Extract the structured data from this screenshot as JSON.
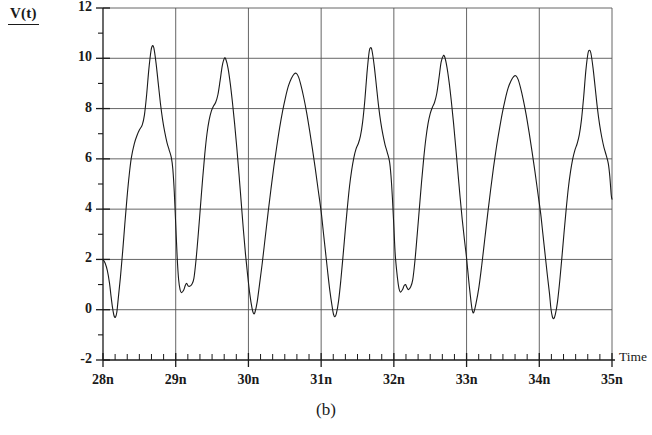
{
  "figure": {
    "caption": "(b)",
    "y_axis_label": "V(t)",
    "x_axis_label": "Time"
  },
  "chart_data": {
    "type": "line",
    "title": "",
    "subtitle": "",
    "xlabel": "Time",
    "ylabel": "V(t)",
    "xunit": "n",
    "xlim": [
      28,
      35
    ],
    "ylim": [
      -2,
      12
    ],
    "grid": true,
    "legend": "none",
    "x_tick_labels": [
      "28n",
      "29n",
      "30n",
      "31n",
      "32n",
      "33n",
      "34n",
      "35n"
    ],
    "x_ticks": [
      28,
      29,
      30,
      31,
      32,
      33,
      34,
      35
    ],
    "x_minor_ticks_per_interval": 5,
    "y_tick_labels": [
      "12",
      "10",
      "8",
      "6",
      "4",
      "2",
      "0",
      "-2"
    ],
    "y_ticks": [
      12,
      10,
      8,
      6,
      4,
      2,
      0,
      -2
    ],
    "y_minor_ticks_per_interval": 1,
    "line_color": "#1a1a1a",
    "line_width": 1.1,
    "gridline_color": "#555555",
    "axis_color": "#1a1a1a",
    "background": "#ffffff",
    "series": [
      {
        "name": "V(t)",
        "points": [
          [
            28.0,
            2.0
          ],
          [
            28.03,
            1.85
          ],
          [
            28.06,
            1.55
          ],
          [
            28.09,
            1.05
          ],
          [
            28.11,
            0.55
          ],
          [
            28.13,
            0.1
          ],
          [
            28.15,
            -0.22
          ],
          [
            28.17,
            -0.3
          ],
          [
            28.19,
            -0.1
          ],
          [
            28.21,
            0.45
          ],
          [
            28.24,
            1.3
          ],
          [
            28.27,
            2.3
          ],
          [
            28.3,
            3.4
          ],
          [
            28.33,
            4.45
          ],
          [
            28.36,
            5.35
          ],
          [
            28.39,
            6.05
          ],
          [
            28.43,
            6.6
          ],
          [
            28.47,
            6.95
          ],
          [
            28.5,
            7.15
          ],
          [
            28.54,
            7.35
          ],
          [
            28.57,
            7.75
          ],
          [
            28.6,
            8.55
          ],
          [
            28.63,
            9.55
          ],
          [
            28.66,
            10.3
          ],
          [
            28.68,
            10.5
          ],
          [
            28.7,
            10.4
          ],
          [
            28.73,
            9.8
          ],
          [
            28.76,
            9.0
          ],
          [
            28.79,
            8.2
          ],
          [
            28.82,
            7.55
          ],
          [
            28.85,
            7.05
          ],
          [
            28.88,
            6.65
          ],
          [
            28.91,
            6.35
          ],
          [
            28.94,
            6.05
          ],
          [
            28.96,
            5.6
          ],
          [
            28.98,
            4.7
          ],
          [
            29.0,
            3.4
          ],
          [
            29.02,
            2.1
          ],
          [
            29.04,
            1.2
          ],
          [
            29.06,
            0.8
          ],
          [
            29.08,
            0.68
          ],
          [
            29.11,
            0.78
          ],
          [
            29.13,
            0.95
          ],
          [
            29.15,
            1.05
          ],
          [
            29.17,
            0.95
          ],
          [
            29.19,
            0.93
          ],
          [
            29.22,
            1.0
          ],
          [
            29.25,
            1.25
          ],
          [
            29.28,
            2.0
          ],
          [
            29.31,
            3.0
          ],
          [
            29.34,
            4.1
          ],
          [
            29.37,
            5.2
          ],
          [
            29.4,
            6.2
          ],
          [
            29.43,
            7.0
          ],
          [
            29.46,
            7.55
          ],
          [
            29.49,
            7.9
          ],
          [
            29.52,
            8.1
          ],
          [
            29.55,
            8.25
          ],
          [
            29.58,
            8.55
          ],
          [
            29.61,
            9.1
          ],
          [
            29.64,
            9.7
          ],
          [
            29.67,
            10.0
          ],
          [
            29.69,
            9.95
          ],
          [
            29.72,
            9.6
          ],
          [
            29.75,
            9.0
          ],
          [
            29.78,
            8.25
          ],
          [
            29.81,
            7.4
          ],
          [
            29.84,
            6.45
          ],
          [
            29.87,
            5.4
          ],
          [
            29.9,
            4.3
          ],
          [
            29.93,
            3.2
          ],
          [
            29.96,
            2.2
          ],
          [
            29.99,
            1.35
          ],
          [
            30.02,
            0.6
          ],
          [
            30.05,
            0.05
          ],
          [
            30.07,
            -0.15
          ],
          [
            30.09,
            -0.1
          ],
          [
            30.12,
            0.3
          ],
          [
            30.15,
            0.95
          ],
          [
            30.19,
            1.85
          ],
          [
            30.23,
            2.85
          ],
          [
            30.27,
            3.85
          ],
          [
            30.31,
            4.8
          ],
          [
            30.35,
            5.7
          ],
          [
            30.39,
            6.5
          ],
          [
            30.43,
            7.25
          ],
          [
            30.47,
            7.9
          ],
          [
            30.51,
            8.45
          ],
          [
            30.55,
            8.9
          ],
          [
            30.59,
            9.2
          ],
          [
            30.63,
            9.38
          ],
          [
            30.66,
            9.4
          ],
          [
            30.69,
            9.25
          ],
          [
            30.72,
            8.95
          ],
          [
            30.76,
            8.45
          ],
          [
            30.8,
            7.85
          ],
          [
            30.84,
            7.15
          ],
          [
            30.88,
            6.4
          ],
          [
            30.92,
            5.6
          ],
          [
            30.96,
            4.75
          ],
          [
            31.0,
            3.9
          ],
          [
            31.03,
            3.1
          ],
          [
            31.06,
            2.3
          ],
          [
            31.09,
            1.5
          ],
          [
            31.12,
            0.75
          ],
          [
            31.15,
            0.15
          ],
          [
            31.17,
            -0.18
          ],
          [
            31.19,
            -0.28
          ],
          [
            31.21,
            -0.15
          ],
          [
            31.24,
            0.35
          ],
          [
            31.27,
            1.15
          ],
          [
            31.3,
            2.1
          ],
          [
            31.33,
            3.1
          ],
          [
            31.36,
            4.05
          ],
          [
            31.39,
            4.9
          ],
          [
            31.42,
            5.55
          ],
          [
            31.45,
            6.05
          ],
          [
            31.48,
            6.4
          ],
          [
            31.51,
            6.6
          ],
          [
            31.54,
            6.9
          ],
          [
            31.57,
            7.45
          ],
          [
            31.6,
            8.3
          ],
          [
            31.63,
            9.4
          ],
          [
            31.66,
            10.25
          ],
          [
            31.68,
            10.42
          ],
          [
            31.7,
            10.3
          ],
          [
            31.73,
            9.7
          ],
          [
            31.76,
            8.9
          ],
          [
            31.79,
            8.1
          ],
          [
            31.82,
            7.45
          ],
          [
            31.85,
            6.95
          ],
          [
            31.88,
            6.55
          ],
          [
            31.91,
            6.25
          ],
          [
            31.94,
            5.9
          ],
          [
            31.96,
            5.35
          ],
          [
            31.98,
            4.45
          ],
          [
            32.0,
            3.3
          ],
          [
            32.02,
            2.15
          ],
          [
            32.05,
            1.25
          ],
          [
            32.07,
            0.85
          ],
          [
            32.09,
            0.7
          ],
          [
            32.12,
            0.8
          ],
          [
            32.14,
            0.95
          ],
          [
            32.16,
            1.0
          ],
          [
            32.18,
            0.88
          ],
          [
            32.2,
            0.8
          ],
          [
            32.23,
            0.9
          ],
          [
            32.26,
            1.2
          ],
          [
            32.29,
            1.95
          ],
          [
            32.32,
            2.95
          ],
          [
            32.35,
            4.0
          ],
          [
            32.38,
            5.05
          ],
          [
            32.41,
            6.0
          ],
          [
            32.44,
            6.8
          ],
          [
            32.47,
            7.4
          ],
          [
            32.5,
            7.8
          ],
          [
            32.53,
            8.05
          ],
          [
            32.56,
            8.25
          ],
          [
            32.59,
            8.6
          ],
          [
            32.62,
            9.2
          ],
          [
            32.65,
            9.85
          ],
          [
            32.68,
            10.1
          ],
          [
            32.7,
            10.05
          ],
          [
            32.73,
            9.65
          ],
          [
            32.76,
            9.05
          ],
          [
            32.79,
            8.3
          ],
          [
            32.82,
            7.45
          ],
          [
            32.85,
            6.5
          ],
          [
            32.88,
            5.5
          ],
          [
            32.91,
            4.5
          ],
          [
            32.94,
            3.6
          ],
          [
            32.97,
            2.8
          ],
          [
            33.0,
            2.05
          ],
          [
            33.03,
            1.15
          ],
          [
            33.06,
            0.35
          ],
          [
            33.08,
            -0.05
          ],
          [
            33.1,
            -0.1
          ],
          [
            33.13,
            0.25
          ],
          [
            33.17,
            0.9
          ],
          [
            33.21,
            1.8
          ],
          [
            33.25,
            2.8
          ],
          [
            33.29,
            3.8
          ],
          [
            33.33,
            4.75
          ],
          [
            33.37,
            5.65
          ],
          [
            33.41,
            6.45
          ],
          [
            33.45,
            7.15
          ],
          [
            33.49,
            7.8
          ],
          [
            33.53,
            8.35
          ],
          [
            33.57,
            8.8
          ],
          [
            33.61,
            9.1
          ],
          [
            33.65,
            9.28
          ],
          [
            33.68,
            9.3
          ],
          [
            33.71,
            9.15
          ],
          [
            33.74,
            8.85
          ],
          [
            33.78,
            8.35
          ],
          [
            33.82,
            7.75
          ],
          [
            33.86,
            7.05
          ],
          [
            33.9,
            6.3
          ],
          [
            33.94,
            5.5
          ],
          [
            33.98,
            4.65
          ],
          [
            34.02,
            3.8
          ],
          [
            34.05,
            3.0
          ],
          [
            34.08,
            2.2
          ],
          [
            34.11,
            1.4
          ],
          [
            34.14,
            0.65
          ],
          [
            34.16,
            0.05
          ],
          [
            34.18,
            -0.28
          ],
          [
            34.2,
            -0.35
          ],
          [
            34.22,
            -0.2
          ],
          [
            34.25,
            0.3
          ],
          [
            34.28,
            1.1
          ],
          [
            34.31,
            2.05
          ],
          [
            34.34,
            3.05
          ],
          [
            34.37,
            4.0
          ],
          [
            34.4,
            4.85
          ],
          [
            34.43,
            5.5
          ],
          [
            34.46,
            6.0
          ],
          [
            34.49,
            6.35
          ],
          [
            34.52,
            6.6
          ],
          [
            34.55,
            6.95
          ],
          [
            34.58,
            7.55
          ],
          [
            34.61,
            8.45
          ],
          [
            34.64,
            9.5
          ],
          [
            34.67,
            10.2
          ],
          [
            34.69,
            10.32
          ],
          [
            34.71,
            10.2
          ],
          [
            34.74,
            9.6
          ],
          [
            34.77,
            8.8
          ],
          [
            34.8,
            8.0
          ],
          [
            34.83,
            7.35
          ],
          [
            34.86,
            6.85
          ],
          [
            34.89,
            6.45
          ],
          [
            34.92,
            6.15
          ],
          [
            34.95,
            5.8
          ],
          [
            34.97,
            5.3
          ],
          [
            34.99,
            4.55
          ],
          [
            35.0,
            4.4
          ]
        ]
      }
    ],
    "annotations": {
      "peaks": [
        10.5,
        10.0,
        9.4,
        10.4,
        10.1,
        9.3,
        10.3
      ],
      "troughs": [
        -0.3,
        0.7,
        -0.15,
        -0.28,
        0.7,
        -0.1,
        -0.35
      ],
      "period_estimate_ns": 1.0
    }
  }
}
